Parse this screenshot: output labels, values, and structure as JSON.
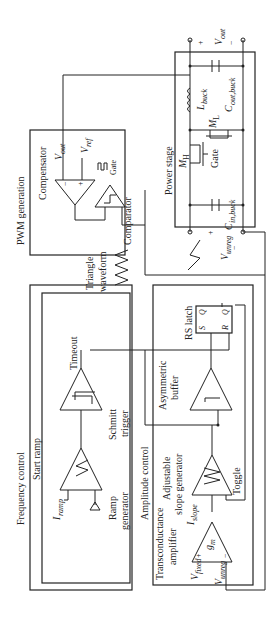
{
  "figure": {
    "orientation": "rotated-90-ccw",
    "blocks": {
      "pwm_generation": {
        "title": "PWM generation",
        "compensator": {
          "label": "Compensator",
          "v_out": "V",
          "v_out_sub": "out",
          "v_ref": "V",
          "v_ref_sub": "ref",
          "minus": "−",
          "plus": "+"
        },
        "comparator": {
          "label": "Comparator",
          "gate": "Gate"
        }
      },
      "triangle": {
        "line1": "Triangle",
        "line2": "waveform"
      },
      "power_stage": {
        "title": "Power stage",
        "mh": "M",
        "mh_sub": "H",
        "ml": "M",
        "ml_sub": "L",
        "gate": "Gate",
        "l_buck": "L",
        "l_buck_sub": "buck",
        "c_out": "C",
        "c_out_sub": "out,buck",
        "c_in": "C",
        "c_in_sub": "in,buck",
        "v_out": "V",
        "v_out_sub": "out",
        "v_unreg": "V",
        "v_unreg_sub": "unreg",
        "plus": "+",
        "minus": "−"
      },
      "frequency_control": {
        "title": "Frequency control",
        "start_ramp": "Start ramp",
        "timeout": "Timeout",
        "schmitt_line1": "Schmitt",
        "schmitt_line2": "trigger",
        "ramp_line1": "Ramp",
        "ramp_line2": "generator",
        "i_ramp": "I",
        "i_ramp_sub": "ramp"
      },
      "amplitude_control": {
        "title": "Amplitude control",
        "rs_latch": "RS latch",
        "s": "S",
        "q": "Q",
        "r": "R",
        "qbar": "Q",
        "asym_line1": "Asymmetric",
        "asym_line2": "buffer",
        "adj_line1": "Adjustable",
        "adj_line2": "slope generator",
        "toggle": "Toggle",
        "i_slope": "I",
        "i_slope_sub": "slope",
        "ta_line1": "Transconductance",
        "ta_line2": "amplifier",
        "gm": "g",
        "gm_sub": "m",
        "v_fixed": "V",
        "v_fixed_sub": "fixed",
        "v_unreg": "V",
        "v_unreg_sub": "unreg",
        "plus": "+",
        "minus": "−"
      }
    }
  }
}
